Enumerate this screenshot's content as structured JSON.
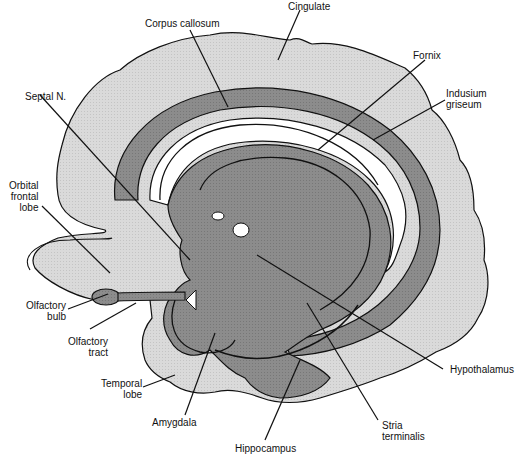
{
  "figure": {
    "colors": {
      "background": "#ffffff",
      "cortex_light": "#dcdcdc",
      "limbic_mid": "#8f8f8f",
      "band_dark": "#7a7a7a",
      "outline": "#111111"
    }
  },
  "labels": {
    "corpus_callosum": "Corpus callosum",
    "cingulate": "Cingulate",
    "fornix": "Fornix",
    "indusium_griseum": "Indusium\ngriseum",
    "septal_n": "Septal N.",
    "orbital_frontal_lobe": "Orbital\nfrontal\nlobe",
    "olfactory_bulb": "Olfactory\nbulb",
    "olfactory_tract": "Olfactory\ntract",
    "temporal_lobe": "Temporal\nlobe",
    "amygdala": "Amygdala",
    "hippocampus": "Hippocampus",
    "stria_terminalis": "Stria\nterminalis",
    "hypothalamus": "Hypothalamus"
  }
}
